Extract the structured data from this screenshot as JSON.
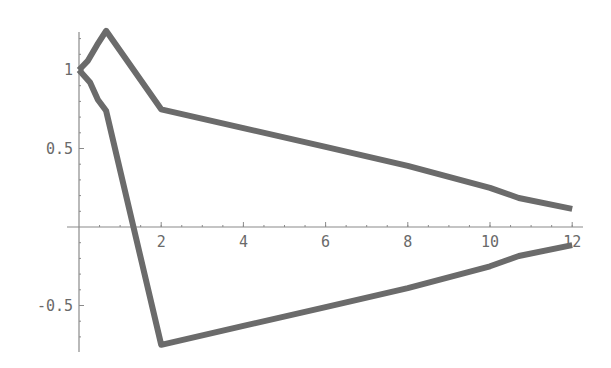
{
  "chart_data": {
    "type": "line",
    "title": "",
    "xlabel": "",
    "ylabel": "",
    "xlim": [
      0,
      12.3
    ],
    "ylim": [
      -0.8,
      1.25
    ],
    "grid": false,
    "legend": null,
    "x_ticks": [
      {
        "value": 2,
        "label": "2"
      },
      {
        "value": 4,
        "label": "4"
      },
      {
        "value": 6,
        "label": "6"
      },
      {
        "value": 8,
        "label": "8"
      },
      {
        "value": 10,
        "label": "10"
      },
      {
        "value": 12,
        "label": "12"
      }
    ],
    "y_ticks": [
      {
        "value": 1,
        "label": "1"
      },
      {
        "value": 0.5,
        "label": "0.5"
      },
      {
        "value": -0.5,
        "label": "-0.5"
      }
    ],
    "x_minor_step": 0.5,
    "y_minor_step": 0.1,
    "series": [
      {
        "name": "upper",
        "color": "#6b6b6b",
        "points": [
          [
            0,
            1.0
          ],
          [
            0.22,
            1.06
          ],
          [
            0.44,
            1.16
          ],
          [
            0.66,
            1.25
          ],
          [
            2.0,
            0.75
          ],
          [
            4,
            0.63
          ],
          [
            6,
            0.51
          ],
          [
            8,
            0.39
          ],
          [
            10,
            0.25
          ],
          [
            10.7,
            0.185
          ],
          [
            12,
            0.115
          ]
        ]
      },
      {
        "name": "lower",
        "color": "#6b6b6b",
        "points": [
          [
            0,
            1.0
          ],
          [
            0.27,
            0.92
          ],
          [
            0.46,
            0.81
          ],
          [
            0.66,
            0.74
          ],
          [
            2.0,
            -0.75
          ],
          [
            4,
            -0.63
          ],
          [
            6,
            -0.51
          ],
          [
            8,
            -0.39
          ],
          [
            10,
            -0.25
          ],
          [
            10.7,
            -0.185
          ],
          [
            12,
            -0.115
          ]
        ]
      }
    ]
  },
  "layout": {
    "x0_px": 79,
    "px_per_x": 41.1,
    "y0_px": 227,
    "px_per_y": 157,
    "x_axis_end_px": 583,
    "y_axis_top_px": 32,
    "y_axis_bottom_px": 352
  }
}
